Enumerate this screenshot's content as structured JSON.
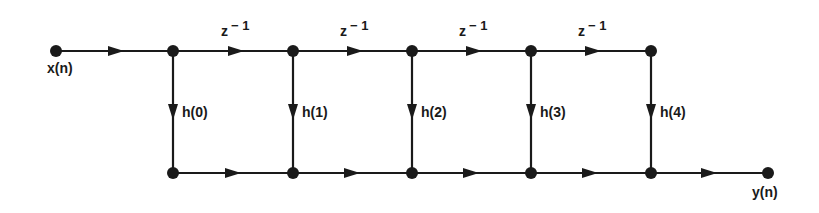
{
  "diagram": {
    "type": "signal-flow-graph",
    "colors": {
      "line": "#1a1a1a",
      "node": "#1a1a1a",
      "background": "#ffffff"
    },
    "input_label": "x(n)",
    "output_label": "y(n)",
    "delay_labels": [
      {
        "base": "z",
        "sup": "− 1"
      },
      {
        "base": "z",
        "sup": "− 1"
      },
      {
        "base": "z",
        "sup": "− 1"
      },
      {
        "base": "z",
        "sup": "− 1"
      }
    ],
    "coefficients": [
      "h(0)",
      "h(1)",
      "h(2)",
      "h(3)",
      "h(4)"
    ]
  }
}
